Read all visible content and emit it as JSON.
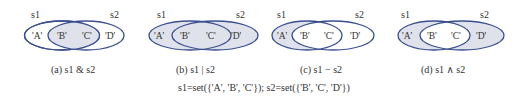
{
  "colors": {
    "stroke": "#3a4f8f",
    "fill": "#dfe2ea",
    "text": "#333333",
    "background": "#ffffff"
  },
  "panels": [
    {
      "id": "a",
      "caption": "(a) s1 & s2",
      "operation": "intersection",
      "set_labels": [
        "s1",
        "s2"
      ],
      "elements": [
        "'A'",
        "'B'",
        "'C'",
        "'D'"
      ],
      "shaded_regions": [
        "B",
        "C"
      ]
    },
    {
      "id": "b",
      "caption": "(b) s1 | s2",
      "operation": "union",
      "set_labels": [
        "s1",
        "s2"
      ],
      "elements": [
        "'A'",
        "'B'",
        "'C'",
        "'D'"
      ],
      "shaded_regions": [
        "A",
        "B",
        "C",
        "D"
      ]
    },
    {
      "id": "c",
      "caption": "(c) s1 − s2",
      "operation": "difference",
      "set_labels": [
        "s1",
        "s2"
      ],
      "elements": [
        "'A'",
        "'B'",
        "'C'",
        "'D'"
      ],
      "shaded_regions": [
        "A"
      ]
    },
    {
      "id": "d",
      "caption": "(d) s1 ∧ s2",
      "operation": "symmetric_difference",
      "set_labels": [
        "s1",
        "s2"
      ],
      "elements": [
        "'A'",
        "'B'",
        "'C'",
        "'D'"
      ],
      "shaded_regions": [
        "A",
        "D"
      ]
    }
  ],
  "formula": "s1=set({'A', 'B', 'C'}); s2=set({'B', 'C', 'D'})"
}
